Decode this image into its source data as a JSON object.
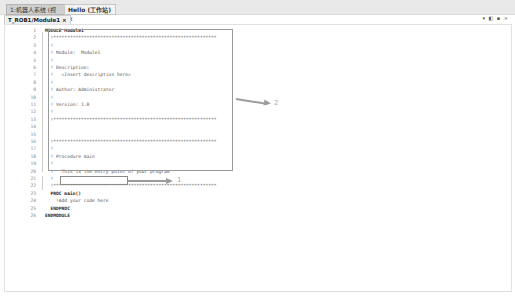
{
  "window": {
    "tabs": [
      {
        "label": "1:机器人系统 (视图)",
        "active": false
      },
      {
        "label": "Hello (工作站) ×",
        "active": true
      }
    ],
    "window_icons": "▾ ◧ ▪ ×"
  },
  "editor": {
    "file_tab": "T_ROB1/Module1 ×",
    "lines": [
      {
        "n": "1",
        "text": "MODULE Module1"
      },
      {
        "n": "2",
        "text": "  !***********************************************************"
      },
      {
        "n": "3",
        "text": "  !"
      },
      {
        "n": "4",
        "text": "  ! Module:  Module1"
      },
      {
        "n": "5",
        "text": "  !"
      },
      {
        "n": "6",
        "text": "  ! Description:"
      },
      {
        "n": "7",
        "text": "  !   <Insert description here>"
      },
      {
        "n": "8",
        "text": "  !"
      },
      {
        "n": "9",
        "text": "  ! Author: Administrator"
      },
      {
        "n": "10",
        "text": "  !"
      },
      {
        "n": "11",
        "text": "  ! Version: 1.0"
      },
      {
        "n": "12",
        "text": "  !"
      },
      {
        "n": "13",
        "text": "  !***********************************************************"
      },
      {
        "n": "14",
        "text": ""
      },
      {
        "n": "15",
        "text": ""
      },
      {
        "n": "16",
        "text": "  !***********************************************************"
      },
      {
        "n": "17",
        "text": "  !"
      },
      {
        "n": "18",
        "text": "  ! Procedure main"
      },
      {
        "n": "19",
        "text": "  !"
      },
      {
        "n": "20",
        "text": "  !   This is the entry point of your program"
      },
      {
        "n": "21",
        "text": "  !"
      },
      {
        "n": "22",
        "text": "  !***********************************************************"
      },
      {
        "n": "23",
        "text": "  PROC main()"
      },
      {
        "n": "24",
        "text": "    !Add your code here"
      },
      {
        "n": "25",
        "text": "  ENDPROC"
      },
      {
        "n": "26",
        "text": "ENDMODULE"
      }
    ]
  },
  "annotations": {
    "callout_1": "1",
    "callout_2": "2"
  }
}
